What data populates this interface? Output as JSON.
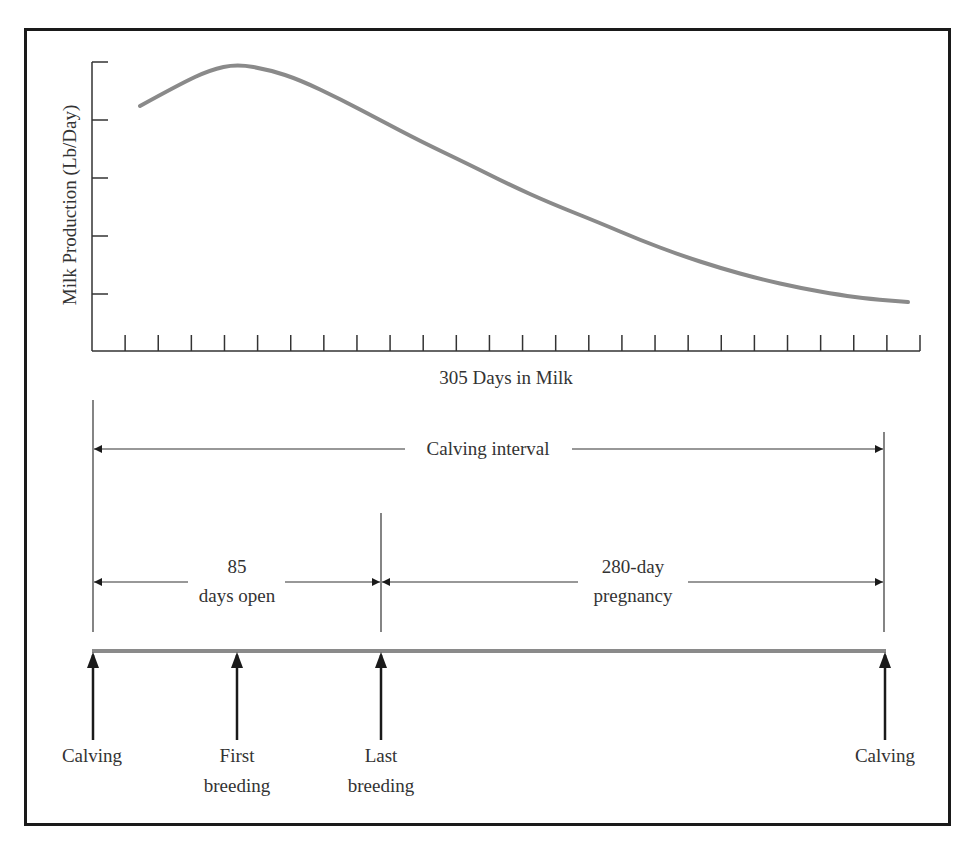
{
  "header_fragment": "",
  "chart_data": {
    "type": "line",
    "title": "",
    "xlabel": "305 Days in Milk",
    "ylabel": "Milk Production (Lb/Day)",
    "x_tick_count": 25,
    "y_tick_count": 5,
    "y_tick_labels": [],
    "x_tick_labels": [],
    "grid": false,
    "legend": null,
    "series": [
      {
        "name": "Lactation curve",
        "color": "#8a8a8a",
        "points_px": [
          [
            140,
            106
          ],
          [
            180,
            84
          ],
          [
            210,
            70
          ],
          [
            237,
            64
          ],
          [
            270,
            70
          ],
          [
            300,
            80
          ],
          [
            340,
            99
          ],
          [
            380,
            120
          ],
          [
            420,
            141
          ],
          [
            470,
            165
          ],
          [
            510,
            185
          ],
          [
            550,
            203
          ],
          [
            600,
            223
          ],
          [
            640,
            240
          ],
          [
            680,
            255
          ],
          [
            720,
            268
          ],
          [
            760,
            279
          ],
          [
            800,
            288
          ],
          [
            840,
            295
          ],
          [
            870,
            299
          ],
          [
            908,
            302
          ]
        ]
      }
    ]
  },
  "timeline": {
    "calving_interval_label": "Calving interval",
    "days_open_value": "85",
    "days_open_label": "days open",
    "pregnancy_value": "280-day",
    "pregnancy_label": "pregnancy",
    "events": [
      {
        "line1": "Calving",
        "line2": ""
      },
      {
        "line1": "First",
        "line2": "breeding"
      },
      {
        "line1": "Last",
        "line2": "breeding"
      },
      {
        "line1": "Calving",
        "line2": ""
      }
    ],
    "bar_color": "#8a8a8a"
  }
}
